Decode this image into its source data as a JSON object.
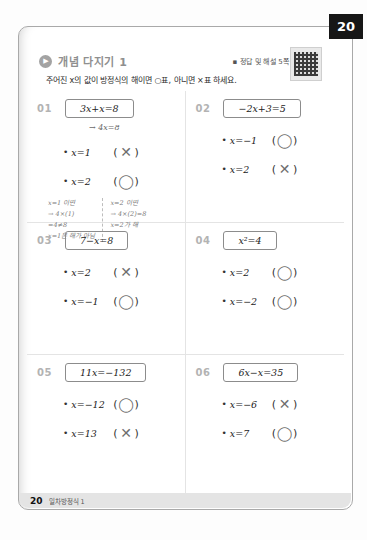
{
  "page": {
    "corner_tab": "20",
    "answers_note": "▪ 정답 및 해설 5쪽",
    "title": "개념 다지기 1",
    "play_glyph": "▶",
    "instruction": "주어진 x의 값이 방정식의 해이면 ○표, 아니면 ×표 하세요.",
    "footer": {
      "page_number": "20",
      "chapter": "일차방정식 1"
    }
  },
  "bullet": "•",
  "paren_open": "(",
  "paren_close": ")",
  "problems": [
    {
      "number": "01",
      "equation": "3x+x=8",
      "work_note": "→ 4x=8",
      "options": [
        {
          "label": "x=1",
          "mark": "✕"
        },
        {
          "label": "x=2",
          "mark": "◯"
        }
      ],
      "solution_note": {
        "left": [
          "x=1 이면",
          "→ 4×(1)",
          "=4≠8",
          "x=1은 해가 아님"
        ],
        "right": [
          "x=2 이면",
          "→ 4×(2)=8",
          "x=2가 해"
        ]
      }
    },
    {
      "number": "02",
      "equation": "−2x+3=5",
      "options": [
        {
          "label": "x=−1",
          "mark": "◯"
        },
        {
          "label": "x=2",
          "mark": "✕"
        }
      ]
    },
    {
      "number": "03",
      "equation": "7−x=8",
      "options": [
        {
          "label": "x=2",
          "mark": "✕"
        },
        {
          "label": "x=−1",
          "mark": "◯"
        }
      ]
    },
    {
      "number": "04",
      "equation": "x²=4",
      "options": [
        {
          "label": "x=2",
          "mark": "◯"
        },
        {
          "label": "x=−2",
          "mark": "◯"
        }
      ]
    },
    {
      "number": "05",
      "equation": "11x=−132",
      "options": [
        {
          "label": "x=−12",
          "mark": "◯"
        },
        {
          "label": "x=13",
          "mark": "✕"
        }
      ]
    },
    {
      "number": "06",
      "equation": "6x−x=35",
      "options": [
        {
          "label": "x=−6",
          "mark": "✕"
        },
        {
          "label": "x=7",
          "mark": "◯"
        }
      ]
    }
  ]
}
